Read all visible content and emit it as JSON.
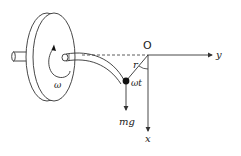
{
  "diagram": {
    "title": "",
    "colors": {
      "stroke": "#333333",
      "background": "#ffffff",
      "mass": "#111111"
    },
    "labels": {
      "origin": "O",
      "y_axis": "y",
      "x_axis": "x",
      "radius": "r",
      "angle": "ωt",
      "omega": "ω",
      "weight": "mg"
    },
    "elements": [
      {
        "id": "disc",
        "type": "rotating-disc"
      },
      {
        "id": "axle",
        "type": "shaft"
      },
      {
        "id": "tube",
        "type": "curved-tube",
        "from": "disc-hub",
        "to": "mass"
      },
      {
        "id": "mass",
        "type": "point-mass"
      },
      {
        "id": "y-axis",
        "type": "arrow",
        "direction": "right"
      },
      {
        "id": "x-axis",
        "type": "arrow",
        "direction": "down"
      },
      {
        "id": "weight-vector",
        "type": "arrow",
        "direction": "down"
      },
      {
        "id": "rotation-arrow",
        "type": "curved-arrow"
      },
      {
        "id": "angle-arc",
        "type": "arc"
      }
    ]
  }
}
